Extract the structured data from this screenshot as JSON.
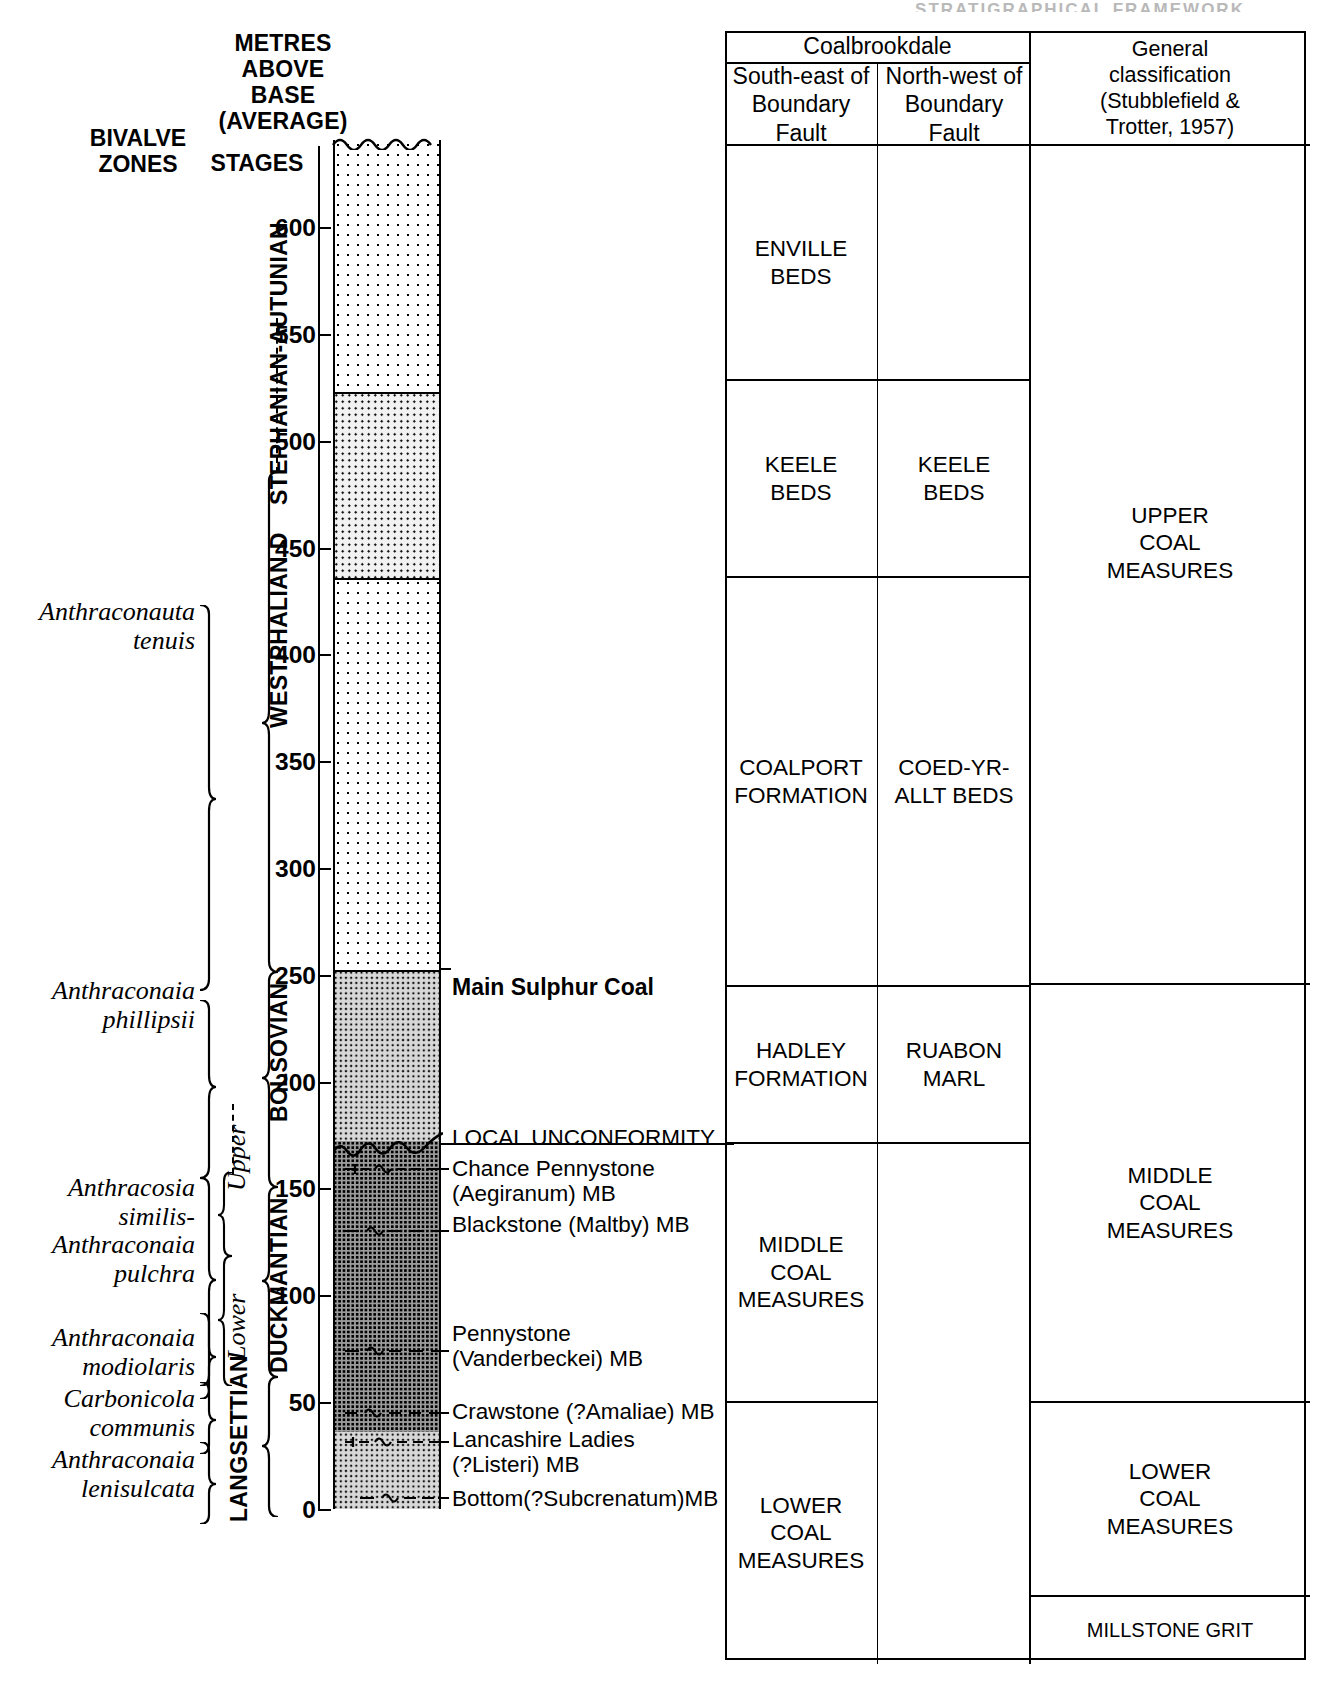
{
  "running_header": "STRATIGRAPHICAL FRAMEWORK",
  "headers": {
    "metres_above_base": "METRES\nABOVE\nBASE\n(AVERAGE)",
    "bivalve_zones": "BIVALVE\nZONES",
    "stages": "STAGES"
  },
  "table": {
    "group_header": "Coalbrookdale",
    "col_se": "South-east of\nBoundary Fault",
    "col_nw": "North-west of\nBoundary Fault",
    "col_general": "General\nclassification\n(Stubblefield &\nTrotter, 1957)",
    "cells": {
      "enville_beds": "ENVILLE\nBEDS",
      "keele_beds_se": "KEELE\nBEDS",
      "keele_beds_nw": "KEELE\nBEDS",
      "coalport_formation": "COALPORT\nFORMATION",
      "coed_yr_allt_beds": "COED-YR-\nALLT BEDS",
      "hadley_formation": "HADLEY\nFORMATION",
      "ruabon_marl": "RUABON\nMARL",
      "middle_coal_measures_se": "MIDDLE\nCOAL\nMEASURES",
      "lower_coal_measures_se": "LOWER\nCOAL\nMEASURES",
      "upper_coal_measures_gen": "UPPER\nCOAL\nMEASURES",
      "middle_coal_measures_gen": "MIDDLE\nCOAL\nMEASURES",
      "lower_coal_measures_gen": "LOWER\nCOAL\nMEASURES",
      "millstone_grit": "MILLSTONE GRIT"
    }
  },
  "axis": {
    "unit": "metres above base (average)",
    "ticks": [
      0,
      50,
      100,
      150,
      200,
      250,
      300,
      350,
      400,
      450,
      500,
      550,
      600
    ],
    "min": 0,
    "max": 640
  },
  "stages": [
    {
      "label": "STEPHANIAN-AUTUNIAN",
      "from": 435,
      "to": 640
    },
    {
      "label": "WESTPHALIAN D",
      "from": 228,
      "to": 435
    },
    {
      "label": "BOLSOVIAN",
      "from": 147,
      "to": 228
    },
    {
      "label": "DUCKMANTIAN",
      "from": 62,
      "to": 147
    },
    {
      "label": "LANGSETTIAN",
      "from": 0,
      "to": 62
    }
  ],
  "substages": [
    {
      "label": "Upper",
      "from": 147,
      "to": 178
    },
    {
      "label": "Lower",
      "from": 88,
      "to": 147
    }
  ],
  "bivalve_zones": [
    {
      "name": "Anthraconauta\ntenuis",
      "from": 270,
      "to": 450
    },
    {
      "name": "Anthraconaia\nphillipsii",
      "from": 178,
      "to": 270
    },
    {
      "name": "Anthracosia\nsimilis-\nAnthraconaia\npulchra",
      "from": 88,
      "to": 178
    },
    {
      "name": "Anthraconaia\nmodiolaris",
      "from": 55,
      "to": 88
    },
    {
      "name": "Carbonicola\ncommunis",
      "from": 36,
      "to": 55
    },
    {
      "name": "Anthraconaia\nlenisulcata",
      "from": 0,
      "to": 36
    }
  ],
  "annotations": [
    {
      "text": "Main Sulphur Coal",
      "level": 252,
      "bold": true,
      "marker": "bed-line"
    },
    {
      "text": "LOCAL UNCONFORMITY",
      "level": 172,
      "bold": false,
      "marker": "wavy"
    },
    {
      "text": "Chance Pennystone\n  (Aegiranum) MB",
      "level": 152,
      "bold": false,
      "marker": "marine-band"
    },
    {
      "text": "Blackstone (Maltby) MB",
      "level": 123,
      "bold": false,
      "marker": "marine-band"
    },
    {
      "text": "Pennystone\n(Vanderbeckei) MB",
      "level": 67,
      "bold": false,
      "marker": "marine-band"
    },
    {
      "text": "Crawstone (?Amaliae) MB",
      "level": 38,
      "bold": false,
      "marker": "marine-band"
    },
    {
      "text": "Lancashire Ladies\n(?Listeri) MB",
      "level": 31,
      "bold": false,
      "marker": "marine-band"
    },
    {
      "text": "Bottom(?Subcrenatum)MB",
      "level": 13,
      "bold": false,
      "marker": "marine-band"
    }
  ],
  "lithology_bands": [
    {
      "name": "enville-sandstone",
      "from": 522,
      "to": 640,
      "fill": "fill-a"
    },
    {
      "name": "keele-beds",
      "from": 435,
      "to": 522,
      "fill": "fill-b"
    },
    {
      "name": "coalport-formation",
      "from": 252,
      "to": 435,
      "fill": "fill-a"
    },
    {
      "name": "hadley-formation",
      "from": 172,
      "to": 252,
      "fill": "fill-c"
    },
    {
      "name": "middle-coal-measures",
      "from": 36,
      "to": 172,
      "fill": "fill-d"
    },
    {
      "name": "lower-coal-measures",
      "from": 0,
      "to": 36,
      "fill": "fill-c"
    }
  ]
}
